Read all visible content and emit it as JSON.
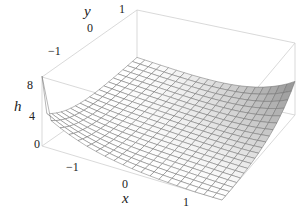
{
  "chart_data": {
    "type": "surface3d",
    "title": "",
    "function_hint": "h(x,y) surface: bowl-like, high at corners (x=-1.5,y=-1.5) and (x=1.5,y=1.5), low near (x,y) plane front",
    "xlabel": "x",
    "ylabel": "y",
    "zlabel": "h",
    "xlim": [
      -1.5,
      1.5
    ],
    "ylim": [
      -1.5,
      1.5
    ],
    "zlim": [
      0,
      8
    ],
    "x_ticks": [
      "-1",
      "0",
      "1"
    ],
    "y_ticks": [
      "-1",
      "0",
      "1"
    ],
    "z_ticks": [
      "0",
      "4",
      "8"
    ],
    "grid_resolution": 20,
    "mesh": true,
    "box": true,
    "colors": {
      "surface_light": "#ffffff",
      "surface_dark": "#8a8a8a",
      "mesh_line": "#6e6e6e",
      "box_line": "#c8c8c8",
      "text": "#222222"
    },
    "corner_heights": {
      "x=-1.5,y=-1.5": 8,
      "x=1.5,y=1.5": 8.5,
      "x=1.5,y=-1.5": 0.3,
      "x=-1.5,y=1.5": 1.5
    }
  },
  "labels": {
    "y_axis": "y",
    "y_tick_pos1": "1",
    "y_tick_0": "0",
    "y_tick_neg1": "−1",
    "z_axis": "h",
    "z_tick_8": "8",
    "z_tick_4": "4",
    "z_tick_0": "0",
    "x_tick_neg1": "−1",
    "x_tick_0": "0",
    "x_axis": "x",
    "x_tick_pos1": "1"
  }
}
